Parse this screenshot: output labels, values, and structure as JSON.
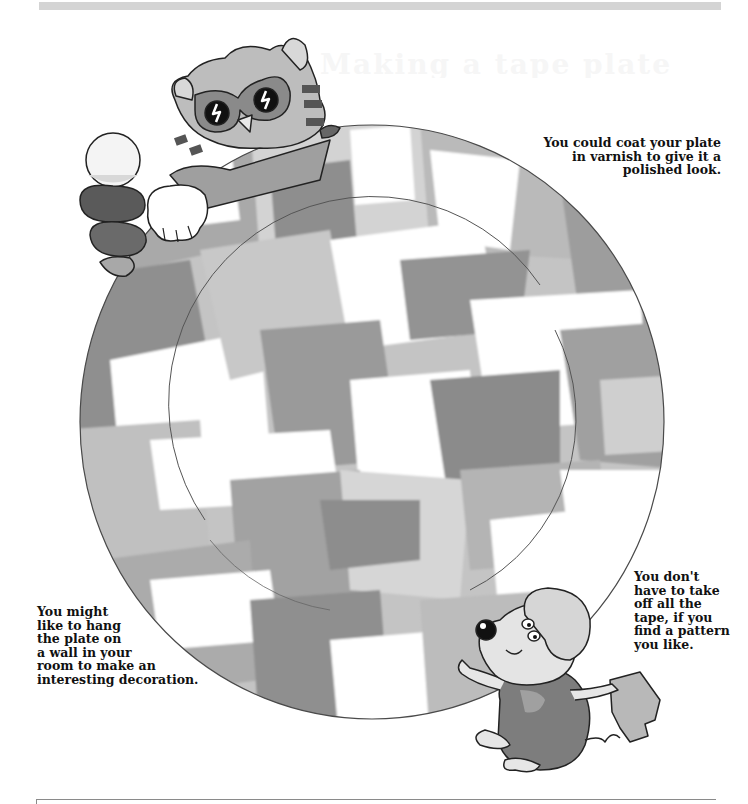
{
  "page": {
    "header_bar_color": "#d4d4d4",
    "ghost_title": "Making a tape plate"
  },
  "captions": {
    "varnish": {
      "lines": [
        "You could coat your plate",
        "in varnish to give it a",
        "polished look."
      ]
    },
    "hang": {
      "lines": [
        "You might",
        "like to hang",
        "the plate on",
        "a wall in your",
        "room to make an",
        "interesting decoration."
      ]
    },
    "tape": {
      "lines": [
        "You don't",
        "have to take",
        "off all the",
        "tape, if you",
        "find a pattern",
        "you like."
      ]
    }
  },
  "illustration": {
    "plate": {
      "description": "decorated-plate-with-torn-tape-pattern",
      "rim_color": "#555555",
      "tape_colors": [
        "#8c8c8c",
        "#a6a6a6",
        "#bdbdbd",
        "#d0d0d0",
        "#ffffff"
      ]
    },
    "characters": [
      {
        "name": "cat-with-glasses",
        "position": "top-left"
      },
      {
        "name": "mouse-holding-tape",
        "position": "bottom-right"
      }
    ]
  }
}
